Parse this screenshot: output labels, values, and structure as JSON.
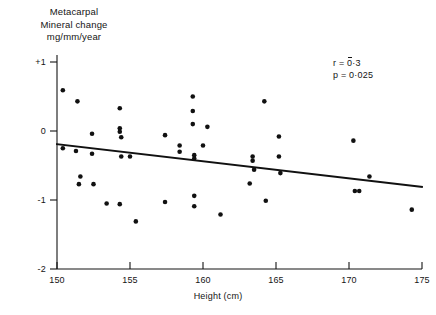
{
  "chart_data": {
    "type": "scatter",
    "title": "",
    "ylabel_lines": [
      "Metacarpal",
      "Mineral change",
      "mg/mm/year"
    ],
    "xlabel": "Height (cm)",
    "xlim": [
      150,
      175
    ],
    "ylim": [
      -2,
      1
    ],
    "xticks": [
      150,
      155,
      160,
      165,
      170,
      175
    ],
    "xtick_labels": [
      "150",
      "155",
      "160",
      "165",
      "170",
      "175"
    ],
    "yticks": [
      1,
      0,
      -1,
      -2
    ],
    "ytick_labels": [
      "+1",
      "0",
      "-1",
      "-2"
    ],
    "grid": false,
    "legend": false,
    "marker": "filled-circle",
    "marker_color": "#111111",
    "line_color": "#111111",
    "points": [
      {
        "x": 150.4,
        "y": 0.59
      },
      {
        "x": 151.4,
        "y": 0.43
      },
      {
        "x": 152.4,
        "y": -0.04
      },
      {
        "x": 150.4,
        "y": -0.25
      },
      {
        "x": 151.3,
        "y": -0.29
      },
      {
        "x": 152.4,
        "y": -0.33
      },
      {
        "x": 151.6,
        "y": -0.66
      },
      {
        "x": 151.5,
        "y": -0.77
      },
      {
        "x": 152.5,
        "y": -0.77
      },
      {
        "x": 153.4,
        "y": -1.05
      },
      {
        "x": 154.3,
        "y": -1.06
      },
      {
        "x": 154.3,
        "y": 0.33
      },
      {
        "x": 154.3,
        "y": 0.04
      },
      {
        "x": 154.3,
        "y": -0.01
      },
      {
        "x": 154.4,
        "y": -0.09
      },
      {
        "x": 154.4,
        "y": -0.37
      },
      {
        "x": 155.0,
        "y": -0.37
      },
      {
        "x": 155.4,
        "y": -1.31
      },
      {
        "x": 157.4,
        "y": -0.06
      },
      {
        "x": 159.3,
        "y": 0.5
      },
      {
        "x": 159.3,
        "y": 0.29
      },
      {
        "x": 159.3,
        "y": 0.1
      },
      {
        "x": 160.3,
        "y": 0.06
      },
      {
        "x": 160.0,
        "y": -0.21
      },
      {
        "x": 158.4,
        "y": -0.21
      },
      {
        "x": 158.4,
        "y": -0.3
      },
      {
        "x": 159.4,
        "y": -0.35
      },
      {
        "x": 159.4,
        "y": -0.4
      },
      {
        "x": 157.4,
        "y": -1.03
      },
      {
        "x": 159.4,
        "y": -0.94
      },
      {
        "x": 159.4,
        "y": -1.09
      },
      {
        "x": 161.2,
        "y": -1.21
      },
      {
        "x": 163.2,
        "y": -0.76
      },
      {
        "x": 164.2,
        "y": 0.43
      },
      {
        "x": 163.4,
        "y": -0.37
      },
      {
        "x": 163.4,
        "y": -0.43
      },
      {
        "x": 163.5,
        "y": -0.56
      },
      {
        "x": 165.2,
        "y": -0.08
      },
      {
        "x": 165.2,
        "y": -0.37
      },
      {
        "x": 165.3,
        "y": -0.61
      },
      {
        "x": 164.3,
        "y": -1.01
      },
      {
        "x": 170.3,
        "y": -0.14
      },
      {
        "x": 171.4,
        "y": -0.66
      },
      {
        "x": 170.4,
        "y": -0.87
      },
      {
        "x": 170.7,
        "y": -0.87
      },
      {
        "x": 174.3,
        "y": -1.14
      }
    ],
    "regression_line": {
      "x_start": 150,
      "y_start": -0.19,
      "x_end": 175,
      "y_end": -0.81
    },
    "annotations": {
      "r_prefix": "r = ",
      "r_overbar": "0",
      "r_rest": "·3",
      "r_full": "r = 0̅3 (negative 0·3)",
      "p_text": "p = 0·025"
    }
  }
}
